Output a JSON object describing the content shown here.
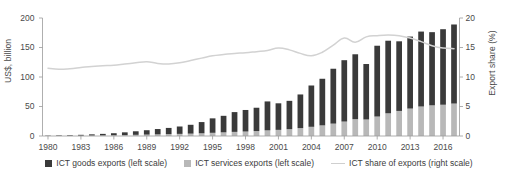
{
  "axes": {
    "ylabel_left": "US$, billion",
    "ylabel_right": "Export share (%)",
    "left_ticks": [
      "0",
      "50",
      "100",
      "150",
      "200"
    ],
    "right_ticks": [
      "0",
      "5",
      "10",
      "15",
      "20"
    ],
    "x_ticks": [
      "1980",
      "1983",
      "1986",
      "1989",
      "1992",
      "1995",
      "1998",
      "2001",
      "2004",
      "2007",
      "2010",
      "2013",
      "2016"
    ]
  },
  "legend": {
    "items": [
      {
        "label": "ICT goods exports (left scale)",
        "type": "swatch",
        "color": "#3a3a3a"
      },
      {
        "label": "ICT services exports (left scale)",
        "type": "swatch",
        "color": "#b8b8b8"
      },
      {
        "label": "ICT share of exports (right scale)",
        "type": "line",
        "color": "#cfcfcf"
      }
    ]
  },
  "colors": {
    "goods": "#3a3a3a",
    "services": "#b8b8b8",
    "line": "#d2d2d2",
    "axis": "#9a9a9a",
    "text": "#4a4a4a"
  },
  "chart_data": {
    "type": "bar",
    "title": "",
    "xlabel": "",
    "ylabel": "US$, billion",
    "ylabel_secondary": "Export share (%)",
    "ylim": [
      0,
      200
    ],
    "ylim_secondary": [
      0,
      20
    ],
    "grid": false,
    "legend_position": "bottom",
    "stacked": true,
    "categories": [
      1980,
      1981,
      1982,
      1983,
      1984,
      1985,
      1986,
      1987,
      1988,
      1989,
      1990,
      1991,
      1992,
      1993,
      1994,
      1995,
      1996,
      1997,
      1998,
      1999,
      2000,
      2001,
      2002,
      2003,
      2004,
      2005,
      2006,
      2007,
      2008,
      2009,
      2010,
      2011,
      2012,
      2013,
      2014,
      2015,
      2016,
      2017
    ],
    "series": [
      {
        "name": "ICT services exports (left scale)",
        "type": "bar",
        "axis": "left",
        "color": "#b8b8b8",
        "values": [
          0.3,
          0.4,
          0.5,
          0.6,
          0.8,
          1.0,
          1.3,
          1.6,
          2.0,
          2.4,
          2.8,
          3.2,
          3.6,
          4.0,
          4.6,
          5.4,
          6.2,
          7.0,
          7.6,
          8.4,
          9.6,
          10.4,
          11.6,
          13.4,
          15.6,
          18.0,
          21.0,
          24.5,
          28.5,
          28.0,
          33.0,
          38.5,
          42.5,
          46.5,
          50.0,
          52.0,
          53.0,
          55.0
        ]
      },
      {
        "name": "ICT goods exports (left scale)",
        "type": "bar",
        "axis": "left",
        "color": "#3a3a3a",
        "values": [
          0.5,
          0.8,
          1.0,
          1.4,
          2.0,
          2.6,
          3.4,
          4.6,
          6.0,
          7.4,
          9.0,
          10.5,
          12.5,
          15.0,
          19.0,
          24.5,
          28.0,
          33.5,
          36.5,
          39.5,
          49.0,
          45.0,
          48.0,
          57.0,
          70.0,
          79.0,
          93.0,
          104.0,
          110.0,
          94.0,
          120.0,
          123.0,
          118.0,
          122.0,
          127.0,
          124.0,
          128.0,
          134.0
        ]
      },
      {
        "name": "ICT share of exports (right scale)",
        "type": "line",
        "axis": "right",
        "color": "#d2d2d2",
        "values": [
          11.5,
          11.3,
          11.4,
          11.6,
          11.8,
          11.9,
          12.0,
          12.2,
          12.4,
          12.6,
          12.3,
          12.2,
          12.4,
          12.8,
          13.2,
          13.6,
          13.8,
          14.0,
          14.1,
          14.3,
          14.5,
          14.9,
          14.6,
          14.0,
          13.6,
          14.2,
          15.4,
          16.6,
          15.9,
          16.8,
          17.0,
          17.1,
          17.0,
          16.6,
          16.0,
          15.3,
          14.9,
          14.8
        ]
      }
    ]
  }
}
